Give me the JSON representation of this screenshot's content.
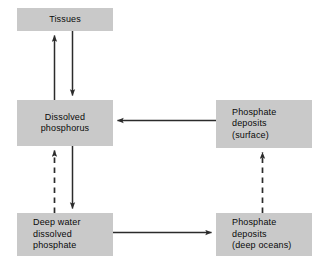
{
  "diagram": {
    "canvas": {
      "width": 322,
      "height": 267,
      "background": "#ffffff"
    },
    "style": {
      "box_fill": "#c9c9c9",
      "text_color": "#0a0a0a",
      "arrow_color": "#2b2b2b"
    },
    "nodes": [
      {
        "id": "tissues",
        "label": "Tissues",
        "align": "center"
      },
      {
        "id": "dissolved_phosphorus",
        "label": "Dissolved\nphosphorus",
        "align": "center"
      },
      {
        "id": "deep_water_dissolved_phosphate",
        "label": "Deep water\ndissolved\nphosphate",
        "align": "left"
      },
      {
        "id": "phosphate_deposits_surface",
        "label": "Phosphate\ndeposits\n(surface)",
        "align": "left"
      },
      {
        "id": "phosphate_deposits_deep_oceans",
        "label": "Phosphate\ndeposits\n(deep oceans)",
        "align": "left"
      }
    ],
    "edges": [
      {
        "id": "dissolved-phosphorus-to-tissues",
        "from": "dissolved_phosphorus",
        "to": "tissues",
        "style": "solid",
        "direction": "up"
      },
      {
        "id": "tissues-to-dissolved-phosphorus",
        "from": "tissues",
        "to": "dissolved_phosphorus",
        "style": "solid",
        "direction": "down"
      },
      {
        "id": "phosphate-deposits-surface-to-dissolved-phosphorus",
        "from": "phosphate_deposits_surface",
        "to": "dissolved_phosphorus",
        "style": "solid",
        "direction": "left"
      },
      {
        "id": "deep-water-dissolved-phosphate-to-dissolved-phosphorus",
        "from": "deep_water_dissolved_phosphate",
        "to": "dissolved_phosphorus",
        "style": "dashed",
        "direction": "up"
      },
      {
        "id": "dissolved-phosphorus-to-deep-water-dissolved-phosphate",
        "from": "dissolved_phosphorus",
        "to": "deep_water_dissolved_phosphate",
        "style": "solid",
        "direction": "down"
      },
      {
        "id": "deep-water-dissolved-phosphate-to-phosphate-deposits-deep-oceans",
        "from": "deep_water_dissolved_phosphate",
        "to": "phosphate_deposits_deep_oceans",
        "style": "solid",
        "direction": "right"
      },
      {
        "id": "phosphate-deposits-deep-oceans-to-phosphate-deposits-surface",
        "from": "phosphate_deposits_deep_oceans",
        "to": "phosphate_deposits_surface",
        "style": "dashed",
        "direction": "up"
      }
    ]
  }
}
